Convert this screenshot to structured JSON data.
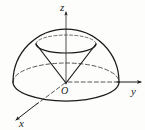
{
  "figure": {
    "title": "",
    "caption": "",
    "background_color": "#fdfdfc",
    "stroke_color": "#1a1a1a",
    "axes": {
      "z": {
        "label": "z",
        "direction": "up",
        "label_x": 60,
        "label_y": 11
      },
      "y": {
        "label": "y",
        "direction": "right",
        "label_x": 131,
        "label_y": 95
      },
      "x": {
        "label": "x",
        "direction": "lower-left",
        "label_x": 19,
        "label_y": 127
      },
      "origin": {
        "label": "O",
        "label_x": 61,
        "label_y": 94
      }
    },
    "solids": [
      {
        "name": "hemisphere-dome",
        "kind": "hemisphere",
        "line_style": "solid outline with dashed hidden equator"
      },
      {
        "name": "inscribed-cone",
        "kind": "cone",
        "apex": "origin",
        "line_style": "solid generatrices, top rim solid in front and dashed behind"
      }
    ]
  }
}
